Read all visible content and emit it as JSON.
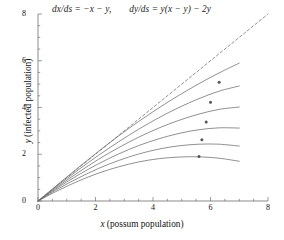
{
  "figure": {
    "equations": {
      "dx": "dx/ds = −x − y,",
      "dy": "dy/ds = y(x − y) − 2y"
    },
    "axes": {
      "x_title_var": "x",
      "x_title_rest": " (possum population)",
      "y_title_var": "y",
      "y_title_rest": " (infected population)"
    }
  },
  "chart_data": {
    "type": "line",
    "title": "",
    "subtitle": "dx/ds = −x − y,   dy/ds = y(x − y) − 2y",
    "xlabel": "x (possum population)",
    "ylabel": "y (infected population)",
    "xlim": [
      0,
      8
    ],
    "ylim": [
      0,
      8
    ],
    "xticks": [
      0,
      2,
      4,
      6,
      8
    ],
    "yticks": [
      0,
      2,
      4,
      6,
      8
    ],
    "xtick_labels": [
      "0",
      "2",
      "4",
      "6",
      "8"
    ],
    "ytick_labels": [
      "0",
      "2",
      "4",
      "6",
      "8"
    ],
    "minor_tick_step": 0.5,
    "grid": false,
    "legend": null,
    "line_color": "#6b6b6b",
    "marker_color": "#555555",
    "series": [
      {
        "name": "separatrix",
        "style": "dashed",
        "marker": null,
        "x": [
          0.0,
          0.8,
          1.6,
          2.4,
          3.2,
          4.0,
          4.8,
          5.6,
          6.4,
          7.2,
          8.0
        ],
        "y": [
          0.0,
          0.8,
          1.6,
          2.4,
          3.2,
          4.0,
          4.8,
          5.6,
          6.4,
          7.2,
          8.0
        ]
      },
      {
        "name": "trajectory-1",
        "style": "solid",
        "marker": null,
        "x": [
          0.0,
          0.7,
          1.4,
          2.1,
          2.8,
          3.5,
          4.2,
          4.9,
          5.6,
          6.3,
          7.0
        ],
        "y": [
          0.0,
          0.72,
          1.43,
          2.12,
          2.78,
          3.4,
          3.98,
          4.52,
          5.02,
          5.48,
          5.9
        ]
      },
      {
        "name": "trajectory-2",
        "style": "solid",
        "marker": {
          "x": 6.3,
          "y": 5.08
        },
        "x": [
          0.0,
          0.7,
          1.4,
          2.1,
          2.8,
          3.5,
          4.2,
          4.9,
          5.6,
          6.3,
          7.0
        ],
        "y": [
          0.0,
          0.68,
          1.33,
          1.95,
          2.53,
          3.07,
          3.56,
          4.0,
          4.38,
          4.7,
          4.92
        ]
      },
      {
        "name": "trajectory-3",
        "style": "solid",
        "marker": {
          "x": 6.0,
          "y": 4.22
        },
        "x": [
          0.0,
          0.7,
          1.4,
          2.1,
          2.8,
          3.5,
          4.2,
          4.9,
          5.6,
          6.3,
          7.0
        ],
        "y": [
          0.0,
          0.63,
          1.22,
          1.78,
          2.28,
          2.73,
          3.12,
          3.45,
          3.72,
          3.92,
          4.02
        ]
      },
      {
        "name": "trajectory-4",
        "style": "solid",
        "marker": {
          "x": 5.85,
          "y": 3.38
        },
        "x": [
          0.0,
          0.7,
          1.4,
          2.1,
          2.8,
          3.5,
          4.2,
          4.9,
          5.6,
          6.3,
          7.0
        ],
        "y": [
          0.0,
          0.58,
          1.11,
          1.59,
          2.01,
          2.37,
          2.66,
          2.89,
          3.05,
          3.13,
          3.12
        ]
      },
      {
        "name": "trajectory-5",
        "style": "solid",
        "marker": {
          "x": 5.7,
          "y": 2.62
        },
        "x": [
          0.0,
          0.7,
          1.4,
          2.1,
          2.8,
          3.5,
          4.2,
          4.9,
          5.6,
          6.3,
          7.0
        ],
        "y": [
          0.0,
          0.52,
          0.98,
          1.39,
          1.73,
          2.01,
          2.22,
          2.36,
          2.43,
          2.43,
          2.35
        ]
      },
      {
        "name": "trajectory-6",
        "style": "solid",
        "marker": {
          "x": 5.6,
          "y": 1.9
        },
        "x": [
          0.0,
          0.7,
          1.4,
          2.1,
          2.8,
          3.5,
          4.2,
          4.9,
          5.6,
          6.3,
          7.0
        ],
        "y": [
          0.0,
          0.45,
          0.85,
          1.19,
          1.46,
          1.67,
          1.81,
          1.88,
          1.89,
          1.83,
          1.7
        ]
      }
    ]
  }
}
